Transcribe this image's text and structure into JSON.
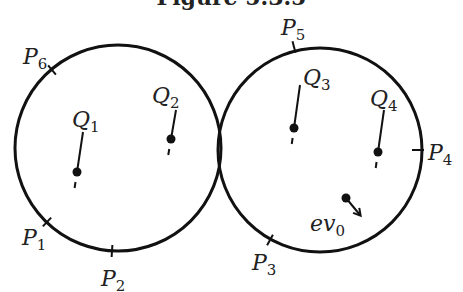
{
  "caption": "Figure 5.3.5",
  "diagram": {
    "circles": [
      {
        "id": "left",
        "cx": 118,
        "cy": 148,
        "r": 103
      },
      {
        "id": "right",
        "cx": 320,
        "cy": 150,
        "r": 102
      }
    ],
    "boundary_points": [
      {
        "name": "P",
        "sub": "1",
        "tick": [
          47,
          222
        ],
        "label_pos": [
          22,
          245
        ]
      },
      {
        "name": "P",
        "sub": "2",
        "tick": [
          112,
          251
        ],
        "label_pos": [
          101,
          286
        ]
      },
      {
        "name": "P",
        "sub": "3",
        "tick": [
          270,
          240
        ],
        "label_pos": [
          252,
          270
        ]
      },
      {
        "name": "P",
        "sub": "4",
        "tick": [
          418,
          150
        ],
        "label_pos": [
          428,
          160
        ]
      },
      {
        "name": "P",
        "sub": "5",
        "tick": [
          294,
          47
        ],
        "label_pos": [
          281,
          35
        ]
      },
      {
        "name": "P",
        "sub": "6",
        "tick": [
          52,
          70
        ],
        "label_pos": [
          23,
          64
        ]
      }
    ],
    "interior_points": [
      {
        "name": "Q",
        "sub": "1",
        "dot": [
          77,
          172
        ],
        "line_top": [
          83,
          132
        ],
        "label_pos": [
          72,
          127
        ]
      },
      {
        "name": "Q",
        "sub": "2",
        "dot": [
          171,
          139
        ],
        "line_top": [
          176,
          110
        ],
        "label_pos": [
          152,
          103
        ]
      },
      {
        "name": "Q",
        "sub": "3",
        "dot": [
          294,
          128
        ],
        "line_top": [
          300,
          85
        ],
        "label_pos": [
          303,
          85
        ]
      },
      {
        "name": "Q",
        "sub": "4",
        "dot": [
          378,
          152
        ],
        "line_top": [
          384,
          110
        ],
        "label_pos": [
          370,
          106
        ]
      }
    ],
    "vector": {
      "name": "ev",
      "sub": "0",
      "dot": [
        346,
        198
      ],
      "arrow_to": [
        360,
        215
      ],
      "label_pos": [
        310,
        231
      ]
    }
  }
}
